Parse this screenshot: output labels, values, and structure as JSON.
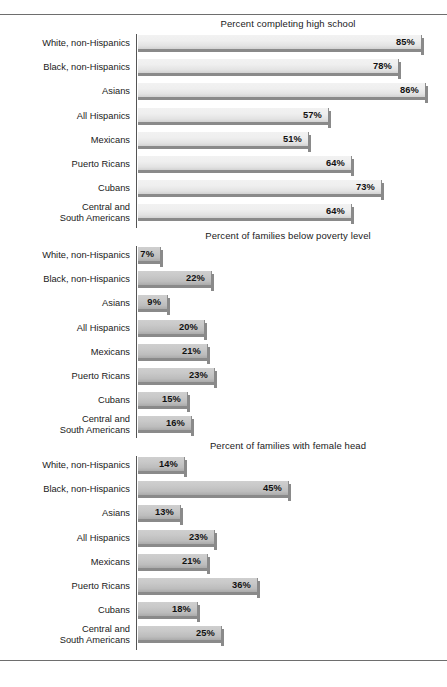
{
  "figure": {
    "categories": [
      "White, non-Hispanics",
      "Black, non-Hispanics",
      "Asians",
      "All Hispanics",
      "Mexicans",
      "Puerto Ricans",
      "Central and\nSouth Americans"
    ]
  },
  "chart_data": [
    {
      "type": "bar",
      "title": "Percent completing high school",
      "orientation": "horizontal",
      "xlabel": "",
      "ylabel": "",
      "xlim": [
        0,
        100
      ],
      "grid": false,
      "legend": "none",
      "categories": [
        "White, non-Hispanics",
        "Black, non-Hispanics",
        "Asians",
        "All Hispanics",
        "Mexicans",
        "Puerto Ricans",
        "Cubans",
        "Central and South Americans"
      ],
      "values": [
        85,
        78,
        86,
        57,
        51,
        64,
        73,
        64
      ],
      "labels": [
        "85%",
        "78%",
        "86%",
        "57%",
        "51%",
        "64%",
        "73%",
        "64%"
      ]
    },
    {
      "type": "bar",
      "title": "Percent of families below poverty level",
      "orientation": "horizontal",
      "xlabel": "",
      "ylabel": "",
      "xlim": [
        0,
        100
      ],
      "grid": false,
      "legend": "none",
      "categories": [
        "White, non-Hispanics",
        "Black, non-Hispanics",
        "Asians",
        "All Hispanics",
        "Mexicans",
        "Puerto Ricans",
        "Cubans",
        "Central and South Americans"
      ],
      "values": [
        7,
        22,
        9,
        20,
        21,
        23,
        15,
        16
      ],
      "labels": [
        "7%",
        "22%",
        "9%",
        "20%",
        "21%",
        "23%",
        "15%",
        "16%"
      ]
    },
    {
      "type": "bar",
      "title": "Percent of families with female head",
      "orientation": "horizontal",
      "xlabel": "",
      "ylabel": "",
      "xlim": [
        0,
        100
      ],
      "grid": false,
      "legend": "none",
      "categories": [
        "White, non-Hispanics",
        "Black, non-Hispanics",
        "Asians",
        "All Hispanics",
        "Mexicans",
        "Puerto Ricans",
        "Cubans",
        "Central and South Americans"
      ],
      "values": [
        14,
        45,
        13,
        23,
        21,
        36,
        18,
        25
      ],
      "labels": [
        "14%",
        "45%",
        "13%",
        "23%",
        "21%",
        "36%",
        "18%",
        "25%"
      ]
    }
  ]
}
